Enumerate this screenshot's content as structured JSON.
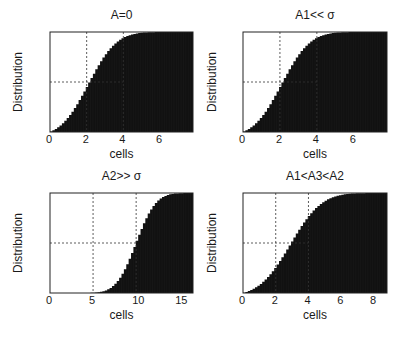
{
  "figure": {
    "panels": [
      {
        "title": "A=0",
        "xlabel": "cells",
        "ylabel": "Distribution"
      },
      {
        "title": "A1<< σ",
        "xlabel": "cells",
        "ylabel": "Distribution"
      },
      {
        "title": "A2>> σ",
        "xlabel": "cells",
        "ylabel": "Distribution"
      },
      {
        "title": "A1<A3<A2",
        "xlabel": "cells",
        "ylabel": "Distribution"
      }
    ]
  },
  "chart_data": [
    {
      "type": "bar",
      "title": "A=0",
      "xlabel": "cells",
      "ylabel": "Distribution",
      "xlim": [
        0,
        7.8
      ],
      "ylim": [
        0,
        1
      ],
      "xticks": [
        0,
        2,
        4,
        6
      ],
      "yticks": [
        0,
        0.5,
        1
      ],
      "ytick_labels": [
        "0",
        "0.5",
        "1"
      ],
      "reference_lines": {
        "vertical": [
          2,
          4
        ],
        "horizontal": [
          0.5
        ]
      },
      "cdf": {
        "mean": 2.1,
        "sd": 1.2,
        "min": 0
      },
      "bar_color": "#111111",
      "x": [
        0,
        0.5,
        1,
        1.5,
        2,
        2.5,
        3,
        3.5,
        4,
        4.5,
        5,
        5.5,
        6,
        6.5,
        7,
        7.5
      ],
      "values": [
        0.0,
        0.04,
        0.12,
        0.25,
        0.43,
        0.58,
        0.7,
        0.8,
        0.87,
        0.93,
        0.97,
        0.99,
        1.0,
        1.0,
        1.0,
        1.0
      ],
      "grid": false
    },
    {
      "type": "bar",
      "title": "A1<< σ",
      "xlabel": "cells",
      "ylabel": "Distribution",
      "xlim": [
        0,
        7.8
      ],
      "ylim": [
        0,
        1
      ],
      "xticks": [
        0,
        2,
        4,
        6
      ],
      "yticks": [
        0,
        0.5,
        1
      ],
      "ytick_labels": [
        "0",
        "0.5",
        "1"
      ],
      "reference_lines": {
        "vertical": [
          2,
          4
        ],
        "horizontal": [
          0.5
        ]
      },
      "cdf": {
        "mean": 2.1,
        "sd": 1.2,
        "min": 0
      },
      "bar_color": "#111111",
      "x": [
        0,
        0.5,
        1,
        1.5,
        2,
        2.5,
        3,
        3.5,
        4,
        4.5,
        5,
        5.5,
        6,
        6.5,
        7,
        7.5
      ],
      "values": [
        0.0,
        0.04,
        0.12,
        0.25,
        0.45,
        0.6,
        0.72,
        0.81,
        0.88,
        0.93,
        0.97,
        0.99,
        1.0,
        1.0,
        1.0,
        1.0
      ],
      "grid": false
    },
    {
      "type": "bar",
      "title": "A2>> σ",
      "xlabel": "cells",
      "ylabel": "Distribution",
      "xlim": [
        0,
        16.6
      ],
      "ylim": [
        0,
        1
      ],
      "xticks": [
        0,
        5,
        10,
        15
      ],
      "yticks": [
        0,
        0.5,
        1
      ],
      "ytick_labels": [
        "0",
        "0.5",
        "1"
      ],
      "reference_lines": {
        "vertical": [
          5,
          10
        ],
        "horizontal": [
          0.5
        ]
      },
      "cdf": {
        "mean": 10.0,
        "sd": 1.8,
        "min": 3.8
      },
      "bar_color": "#111111",
      "x": [
        4,
        5,
        6,
        7,
        8,
        9,
        10,
        11,
        12,
        13,
        14,
        15,
        16
      ],
      "values": [
        0.0,
        0.01,
        0.03,
        0.08,
        0.17,
        0.32,
        0.5,
        0.68,
        0.83,
        0.93,
        0.98,
        1.0,
        1.0
      ],
      "grid": false
    },
    {
      "type": "bar",
      "title": "A1<A3<A2",
      "xlabel": "cells",
      "ylabel": "Distribution",
      "xlim": [
        0,
        8.8
      ],
      "ylim": [
        0,
        1
      ],
      "xticks": [
        0,
        2,
        4,
        6,
        8
      ],
      "yticks": [
        0,
        0.5,
        1
      ],
      "ytick_labels": [
        "0",
        "0.5",
        "1"
      ],
      "reference_lines": {
        "vertical": [
          2,
          4
        ],
        "horizontal": [
          0.5
        ]
      },
      "cdf": {
        "mean": 2.9,
        "sd": 1.5,
        "min": 0
      },
      "bar_color": "#111111",
      "x": [
        0,
        1,
        2,
        3,
        4,
        5,
        6,
        7,
        8
      ],
      "values": [
        0.0,
        0.08,
        0.3,
        0.52,
        0.75,
        0.9,
        0.97,
        1.0,
        1.0
      ],
      "grid": false
    }
  ]
}
